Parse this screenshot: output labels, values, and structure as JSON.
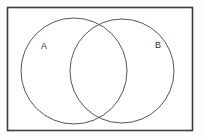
{
  "figure": {
    "type": "venn-diagram",
    "sets": 2,
    "title": "",
    "background_color": "#fdfdfd",
    "universe": {
      "name": "universal-set-rectangle",
      "label": "",
      "x": 7.5,
      "y": 7.5,
      "width": 185,
      "height": 123,
      "stroke": "#3c3c3c",
      "stroke_width": 1.6,
      "fill": "#ffffff"
    },
    "circles": [
      {
        "id": "A",
        "label": "A",
        "cx": 74,
        "cy": 71,
        "r": 53,
        "stroke": "#555555",
        "stroke_width": 1,
        "fill": "none",
        "label_x": 44,
        "label_y": 47
      },
      {
        "id": "B",
        "label": "B",
        "cx": 122,
        "cy": 71,
        "r": 52,
        "stroke": "#555555",
        "stroke_width": 1,
        "fill": "none",
        "label_x": 158,
        "label_y": 46
      }
    ]
  }
}
